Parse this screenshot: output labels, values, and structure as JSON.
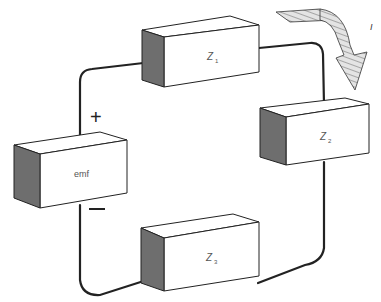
{
  "diagram": {
    "type": "series circuit",
    "components": [
      {
        "id": "emf",
        "label": "emf"
      },
      {
        "id": "z1",
        "label": "Z",
        "subscript": "1"
      },
      {
        "id": "z2",
        "label": "Z",
        "subscript": "2"
      },
      {
        "id": "z3",
        "label": "Z",
        "subscript": "3"
      }
    ],
    "terminals": {
      "plus": "+",
      "minus": "−"
    },
    "current": {
      "label": "I"
    },
    "colors": {
      "shade": "#6e6e6e",
      "line": "#222222",
      "hatch": "#9a9a9a"
    }
  }
}
